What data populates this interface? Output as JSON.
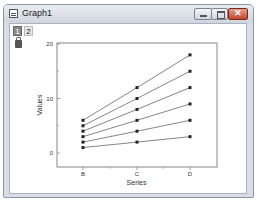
{
  "window": {
    "title": "Graph1",
    "layer_tabs": [
      "1",
      "2"
    ],
    "active_layer": "1",
    "controls": [
      "minimize",
      "maximize",
      "close"
    ]
  },
  "chart_data": {
    "type": "line",
    "title": "",
    "xlabel": "Series",
    "ylabel": "Values",
    "categories": [
      "B",
      "C",
      "D"
    ],
    "ylim": [
      -2,
      20
    ],
    "yticks": [
      0,
      10,
      20
    ],
    "grid": false,
    "legend": "none",
    "marker": "square",
    "series": [
      {
        "name": "Series 1",
        "values": [
          1,
          2,
          3
        ]
      },
      {
        "name": "Series 2",
        "values": [
          2,
          4,
          6
        ]
      },
      {
        "name": "Series 3",
        "values": [
          3,
          6,
          9
        ]
      },
      {
        "name": "Series 4",
        "values": [
          4,
          8,
          12
        ]
      },
      {
        "name": "Series 5",
        "values": [
          5,
          10,
          15
        ]
      },
      {
        "name": "Series 6",
        "values": [
          6,
          12,
          18
        ]
      }
    ]
  },
  "colors": {
    "line": "#666666",
    "marker": "#222222",
    "axis": "#888888"
  }
}
